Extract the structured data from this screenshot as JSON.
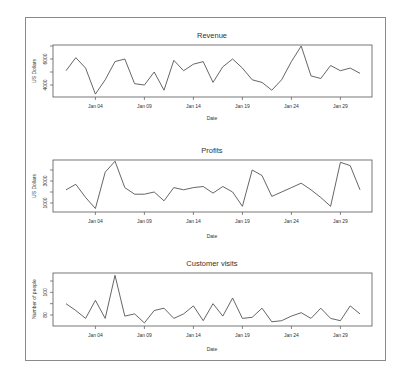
{
  "chart_data": [
    {
      "type": "line",
      "title": "Revenue",
      "xlabel": "Date",
      "ylabel": "US Dollars",
      "x_tick_labels": [
        "Jan 04",
        "Jan 09",
        "Jan 14",
        "Jan 19",
        "Jan 24",
        "Jan 29"
      ],
      "y_tick_labels": [
        "4000",
        "6000"
      ],
      "ylim": [
        3300,
        7100
      ],
      "grid": false,
      "x": [
        "Jan 01",
        "Jan 02",
        "Jan 03",
        "Jan 04",
        "Jan 05",
        "Jan 06",
        "Jan 07",
        "Jan 08",
        "Jan 09",
        "Jan 10",
        "Jan 11",
        "Jan 12",
        "Jan 13",
        "Jan 14",
        "Jan 15",
        "Jan 16",
        "Jan 17",
        "Jan 18",
        "Jan 19",
        "Jan 20",
        "Jan 21",
        "Jan 22",
        "Jan 23",
        "Jan 24",
        "Jan 25",
        "Jan 26",
        "Jan 27",
        "Jan 28",
        "Jan 29",
        "Jan 30",
        "Jan 31"
      ],
      "values": [
        5100,
        6100,
        5300,
        3300,
        4400,
        5800,
        6000,
        4100,
        4000,
        5000,
        3600,
        5900,
        5100,
        5600,
        5800,
        4200,
        5400,
        6000,
        5300,
        4400,
        4200,
        3600,
        4400,
        5800,
        7000,
        4700,
        4500,
        5500,
        5100,
        5300,
        4900
      ]
    },
    {
      "type": "line",
      "title": "Profits",
      "xlabel": "Date",
      "ylabel": "US Dollars",
      "x_tick_labels": [
        "Jan 04",
        "Jan 09",
        "Jan 14",
        "Jan 19",
        "Jan 24",
        "Jan 29"
      ],
      "y_tick_labels": [
        "1000",
        "3000"
      ],
      "ylim": [
        500,
        4900
      ],
      "grid": false,
      "x": [
        "Jan 01",
        "Jan 02",
        "Jan 03",
        "Jan 04",
        "Jan 05",
        "Jan 06",
        "Jan 07",
        "Jan 08",
        "Jan 09",
        "Jan 10",
        "Jan 11",
        "Jan 12",
        "Jan 13",
        "Jan 14",
        "Jan 15",
        "Jan 16",
        "Jan 17",
        "Jan 18",
        "Jan 19",
        "Jan 20",
        "Jan 21",
        "Jan 22",
        "Jan 23",
        "Jan 24",
        "Jan 25",
        "Jan 26",
        "Jan 27",
        "Jan 28",
        "Jan 29",
        "Jan 30",
        "Jan 31"
      ],
      "values": [
        2200,
        2700,
        1500,
        500,
        3800,
        4800,
        2400,
        1800,
        1800,
        2000,
        1200,
        2400,
        2200,
        2400,
        2500,
        1900,
        2500,
        2000,
        700,
        4000,
        3500,
        1600,
        2000,
        2400,
        2800,
        2200,
        1500,
        700,
        4700,
        4400,
        2200
      ]
    },
    {
      "type": "line",
      "title": "Customer visits",
      "xlabel": "Date",
      "ylabel": "Number of people",
      "x_tick_labels": [
        "Jan 04",
        "Jan 09",
        "Jan 14",
        "Jan 19",
        "Jan 24",
        "Jan 29"
      ],
      "y_tick_labels": [
        "80",
        "100"
      ],
      "ylim": [
        73,
        116
      ],
      "grid": false,
      "x": [
        "Jan 01",
        "Jan 02",
        "Jan 03",
        "Jan 04",
        "Jan 05",
        "Jan 06",
        "Jan 07",
        "Jan 08",
        "Jan 09",
        "Jan 10",
        "Jan 11",
        "Jan 12",
        "Jan 13",
        "Jan 14",
        "Jan 15",
        "Jan 16",
        "Jan 17",
        "Jan 18",
        "Jan 19",
        "Jan 20",
        "Jan 21",
        "Jan 22",
        "Jan 23",
        "Jan 24",
        "Jan 25",
        "Jan 26",
        "Jan 27",
        "Jan 28",
        "Jan 29",
        "Jan 30",
        "Jan 31"
      ],
      "values": [
        90,
        84,
        77,
        93,
        77,
        115,
        79,
        81,
        73,
        84,
        86,
        77,
        81,
        88,
        75,
        90,
        79,
        95,
        77,
        78,
        86,
        74,
        75,
        79,
        82,
        77,
        86,
        77,
        75,
        88,
        81
      ]
    }
  ],
  "panels": [
    {
      "title": "Revenue",
      "ylabel": "US Dollars",
      "xlabel": "Date",
      "yticks": [
        {
          "label": "6000",
          "value": 6000
        },
        {
          "label": "4000",
          "value": 4000
        }
      ],
      "yminor": [
        7000,
        5000
      ],
      "top": 45,
      "bottom": 97,
      "yscale": {
        "v0": 7000,
        "y0": 46,
        "v1": 4000,
        "y1": 85
      }
    },
    {
      "title": "Profits",
      "ylabel": "US Dollars",
      "xlabel": "Date",
      "yticks": [
        {
          "label": "3000",
          "value": 3000
        },
        {
          "label": "1000",
          "value": 1000
        }
      ],
      "yminor": [
        4000,
        2000
      ],
      "top": 160,
      "bottom": 212,
      "yscale": {
        "v0": 4000,
        "y0": 170,
        "v1": 1000,
        "y1": 203
      }
    },
    {
      "title": "Customer visits",
      "ylabel": "Number of people",
      "xlabel": "Date",
      "yticks": [
        {
          "label": "100",
          "value": 100
        },
        {
          "label": "80",
          "value": 80
        }
      ],
      "yminor": [
        110,
        90
      ],
      "top": 273,
      "bottom": 326,
      "yscale": {
        "v0": 110,
        "y0": 281,
        "v1": 80,
        "y1": 315
      }
    }
  ],
  "xaxis": {
    "ticks": [
      {
        "label": "Jan 04",
        "day": 4
      },
      {
        "label": "Jan 09",
        "day": 9
      },
      {
        "label": "Jan 14",
        "day": 14
      },
      {
        "label": "Jan 19",
        "day": 19
      },
      {
        "label": "Jan 24",
        "day": 24
      },
      {
        "label": "Jan 29",
        "day": 29
      }
    ]
  },
  "colors": {
    "line": "#555555",
    "axis": "#555555",
    "frame": "#8a8a8a",
    "text": "#333333"
  }
}
